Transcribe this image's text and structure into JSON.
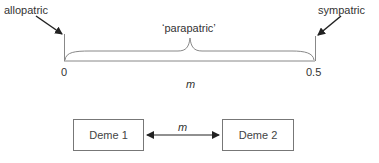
{
  "diagram": {
    "labels": {
      "allopatric": "allopatric",
      "sympatric": "sympatric",
      "parapatric": "‘parapatric’",
      "axis_start": "0",
      "axis_end": "0.5",
      "axis_variable": "m"
    },
    "demes": {
      "deme1": "Deme 1",
      "deme2": "Deme 2",
      "migration_label": "m"
    }
  }
}
